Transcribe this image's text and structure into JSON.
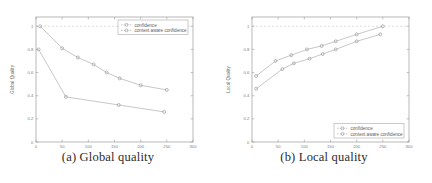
{
  "figure": {
    "panels": [
      {
        "id": "panel-a",
        "caption": "(a) Global quality",
        "legend_position": "top-right",
        "chart_data": {
          "type": "line",
          "title": "",
          "xlabel": "number of portal tags",
          "ylabel": "Global Quality",
          "xlim": [
            0,
            300
          ],
          "ylim": [
            0,
            1.08
          ],
          "xticks": [
            0,
            50,
            100,
            150,
            200,
            250,
            300
          ],
          "xticklabels": [
            "0",
            "50",
            "100",
            "150",
            "200",
            "250",
            "300"
          ],
          "yticks": [
            0,
            0.2,
            0.4,
            0.6,
            0.8,
            1
          ],
          "yticklabels": [
            "0",
            "0.2",
            "0.4",
            "0.6",
            "0.8",
            "1"
          ],
          "grid": false,
          "reference_line": {
            "y": 1,
            "style": "dashed"
          },
          "legend": [
            "confidence",
            "context aware confidence"
          ],
          "series": [
            {
              "name": "confidence",
              "marker": "circle",
              "x": [
                5,
                57,
                158,
                245
              ],
              "y": [
                0.8,
                0.39,
                0.32,
                0.26
              ]
            },
            {
              "name": "context aware confidence",
              "marker": "circle",
              "x": [
                8,
                50,
                80,
                110,
                135,
                160,
                200,
                250
              ],
              "y": [
                1.0,
                0.81,
                0.73,
                0.67,
                0.6,
                0.55,
                0.49,
                0.45
              ]
            }
          ]
        }
      },
      {
        "id": "panel-b",
        "caption": "(b) Local quality",
        "legend_position": "bottom-right",
        "chart_data": {
          "type": "line",
          "title": "",
          "xlabel": "number of portal tags",
          "ylabel": "Local Quality",
          "xlim": [
            0,
            300
          ],
          "ylim": [
            0,
            1.08
          ],
          "xticks": [
            0,
            50,
            100,
            150,
            200,
            250,
            300
          ],
          "xticklabels": [
            "0",
            "50",
            "100",
            "150",
            "200",
            "250",
            "300"
          ],
          "yticks": [
            0,
            0.2,
            0.4,
            0.6,
            0.8,
            1
          ],
          "yticklabels": [
            "0",
            "0.2",
            "0.4",
            "0.6",
            "0.8",
            "1"
          ],
          "grid": false,
          "reference_line": {
            "y": 1,
            "style": "dashed"
          },
          "legend": [
            "confidence",
            "context aware confidence"
          ],
          "series": [
            {
              "name": "confidence",
              "marker": "circle",
              "x": [
                8,
                58,
                80,
                110,
                135,
                160,
                200,
                245
              ],
              "y": [
                0.46,
                0.63,
                0.68,
                0.72,
                0.76,
                0.8,
                0.87,
                0.93
              ]
            },
            {
              "name": "context aware confidence",
              "marker": "circle",
              "x": [
                8,
                45,
                75,
                105,
                133,
                160,
                200,
                250
              ],
              "y": [
                0.57,
                0.7,
                0.75,
                0.8,
                0.83,
                0.87,
                0.93,
                1.0
              ]
            }
          ]
        }
      }
    ]
  }
}
